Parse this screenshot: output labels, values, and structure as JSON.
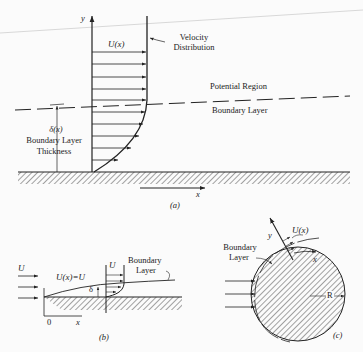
{
  "panel_a": {
    "y_axis_label": "y",
    "x_axis_label": "x",
    "freestream_label": "U(x)",
    "velocity_label_line1": "Velocity",
    "velocity_label_line2": "Distribution",
    "potential_region_label": "Potential Region",
    "boundary_layer_label": "Boundary Layer",
    "delta_label": "δ(x)",
    "thickness_line1": "Boundary Layer",
    "thickness_line2": "Thickness",
    "caption": "(a)"
  },
  "panel_b": {
    "inflow_label": "U",
    "edge_label": "U(x)=U",
    "profile_label": "U",
    "delta_label": "δ",
    "bl_line1": "Boundary",
    "bl_line2": "Layer",
    "origin_label": "0",
    "x_axis_label": "x",
    "caption": "(b)"
  },
  "panel_c": {
    "y_axis_label": "y",
    "x_axis_label": "x",
    "velocity_label": "U(x)",
    "bl_line1": "Boundary",
    "bl_line2": "Layer",
    "radius_label": "R",
    "caption": "(c)"
  }
}
